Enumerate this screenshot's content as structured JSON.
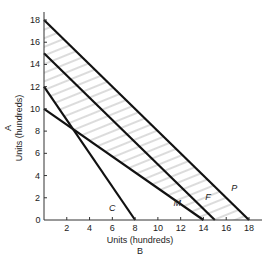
{
  "chart_data": {
    "type": "line",
    "title": "",
    "xlabel": "Units (hundreds)",
    "xlabel_sub": "B",
    "ylabel": "Units (hundreds)",
    "ylabel_sub": "A",
    "xlim": [
      0,
      18
    ],
    "ylim": [
      0,
      18
    ],
    "x_ticks": [
      2,
      4,
      6,
      8,
      10,
      12,
      14,
      16,
      18
    ],
    "y_ticks": [
      0,
      2,
      4,
      6,
      8,
      10,
      12,
      14,
      16,
      18
    ],
    "origin_label": "0",
    "grid": false,
    "legend": "none",
    "series": [
      {
        "name": "P",
        "points": [
          [
            0,
            18
          ],
          [
            18,
            0
          ]
        ],
        "label_pos": [
          16.7,
          2.6
        ]
      },
      {
        "name": "F",
        "points": [
          [
            0,
            15
          ],
          [
            15,
            0
          ]
        ],
        "label_pos": [
          14.4,
          1.8
        ]
      },
      {
        "name": "M",
        "points": [
          [
            0,
            10
          ],
          [
            14,
            0
          ]
        ],
        "label_pos": [
          11.7,
          1.3
        ]
      },
      {
        "name": "C",
        "points": [
          [
            0,
            12
          ],
          [
            8,
            0
          ]
        ],
        "label_pos": [
          6.0,
          0.8
        ]
      }
    ],
    "shaded_region": "hatched area between line P and the lower envelope of lines C and M"
  }
}
